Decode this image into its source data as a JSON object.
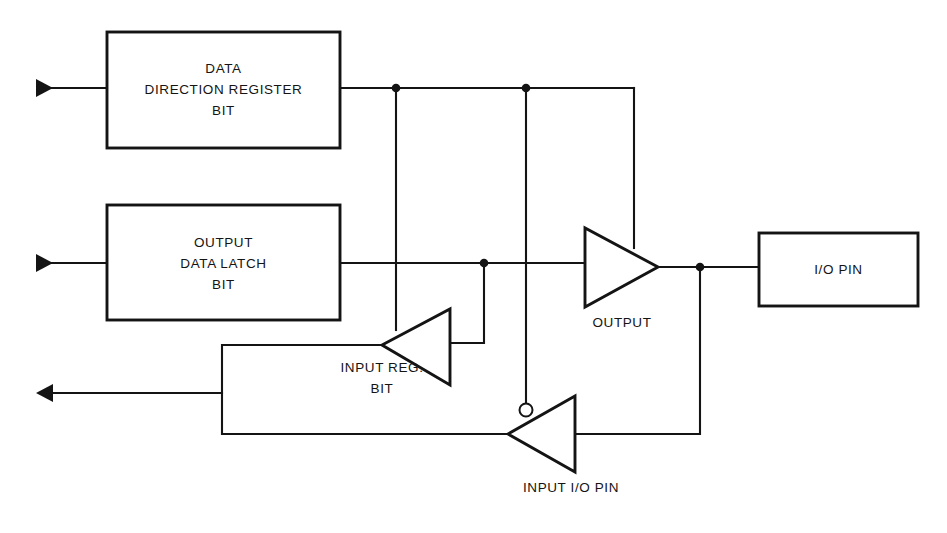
{
  "diagram": {
    "background_color": "#ffffff",
    "line_color": "#141414",
    "blocks": [
      {
        "id": "ddr",
        "name": "data-direction-register-bit",
        "lines": [
          "DATA",
          "DIRECTION REGISTER",
          "BIT"
        ],
        "x": 107,
        "y": 32,
        "w": 233,
        "h": 116
      },
      {
        "id": "latch",
        "name": "output-data-latch-bit",
        "lines": [
          "OUTPUT",
          "DATA LATCH",
          "BIT"
        ],
        "x": 107,
        "y": 205,
        "w": 233,
        "h": 115
      },
      {
        "id": "iopin",
        "name": "io-pin-block",
        "lines": [
          "I/O PIN"
        ],
        "x": 759,
        "y": 233,
        "w": 159,
        "h": 73
      }
    ],
    "buffers": [
      {
        "id": "output_buffer",
        "name": "output-buffer",
        "label": "OUTPUT",
        "direction": "right",
        "inverting": false,
        "label_x": 622,
        "label_y": 327
      },
      {
        "id": "input_reg_buffer",
        "name": "input-register-buffer",
        "label_lines": [
          "INPUT REG.",
          "BIT"
        ],
        "direction": "left",
        "inverting": false,
        "label_x": 382,
        "label_y": 372
      },
      {
        "id": "input_io_buffer",
        "name": "input-io-pin-buffer",
        "label": "INPUT I/O PIN",
        "direction": "right",
        "inverting": true,
        "label_x": 571,
        "label_y": 477
      }
    ],
    "ports": [
      {
        "id": "ddr_in",
        "name": "ddr-input-arrow",
        "direction": "in",
        "x": 36,
        "y": 88
      },
      {
        "id": "latch_in",
        "name": "latch-input-arrow",
        "direction": "in",
        "x": 36,
        "y": 263
      },
      {
        "id": "reg_out",
        "name": "input-register-output-arrow",
        "direction": "out",
        "x": 36,
        "y": 393
      }
    ],
    "junctions": [
      {
        "name": "ddr-output-junction-a",
        "x": 396,
        "y": 88
      },
      {
        "name": "ddr-output-junction-b",
        "x": 526,
        "y": 88
      },
      {
        "name": "latch-output-junction",
        "x": 484,
        "y": 263
      },
      {
        "name": "io-pin-junction",
        "x": 700,
        "y": 267
      }
    ]
  }
}
